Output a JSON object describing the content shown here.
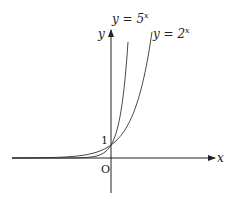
{
  "diagram": {
    "x_axis_label": "x",
    "y_axis_label": "y",
    "origin_label": "O",
    "intercept_label": "1",
    "curves": [
      {
        "label": "y = 5",
        "exponent": "x",
        "base": 5
      },
      {
        "label": "y = 2",
        "exponent": "x",
        "base": 2
      }
    ]
  }
}
